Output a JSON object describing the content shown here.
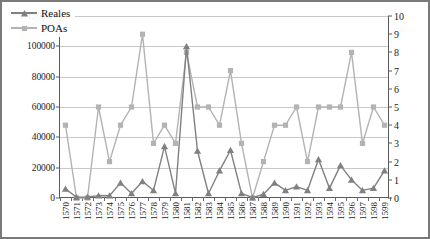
{
  "chart_data": {
    "type": "line",
    "title": "",
    "xlabel": "",
    "ylabel": "",
    "grid": true,
    "legend_position": "top-left",
    "categories": [
      "1570",
      "1571",
      "1572",
      "1573",
      "1574",
      "1575",
      "1576",
      "1577",
      "1578",
      "1579",
      "1580",
      "1581",
      "1582",
      "1583",
      "1584",
      "1585",
      "1586",
      "1587",
      "1588",
      "1589",
      "1590",
      "1591",
      "1592",
      "1593",
      "1594",
      "1595",
      "1596",
      "1597",
      "1598",
      "1599"
    ],
    "left_axis": {
      "label": "",
      "ylim": [
        0,
        120000
      ],
      "ticks": [
        "0",
        "20000",
        "40000",
        "60000",
        "80000",
        "100000",
        "120000"
      ],
      "tick_values": [
        0,
        20000,
        40000,
        60000,
        80000,
        100000,
        120000
      ]
    },
    "right_axis": {
      "label": "",
      "ylim": [
        0,
        10
      ],
      "ticks": [
        "0",
        "1",
        "2",
        "3",
        "4",
        "5",
        "6",
        "7",
        "8",
        "9",
        "10"
      ],
      "tick_values": [
        0,
        1,
        2,
        3,
        4,
        5,
        6,
        7,
        8,
        9,
        10
      ]
    },
    "series": [
      {
        "name": "Reales",
        "axis": "left",
        "color": "#808080",
        "marker": "triangle",
        "values": [
          6000,
          500,
          700,
          1600,
          1500,
          10000,
          3000,
          11000,
          5000,
          34000,
          3000,
          100000,
          31000,
          3000,
          18000,
          31500,
          3000,
          200,
          2500,
          10000,
          5000,
          7500,
          5000,
          25500,
          6500,
          21500,
          12000,
          5000,
          6500,
          18000
        ]
      },
      {
        "name": "POAs",
        "axis": "right",
        "color": "#b3b3b3",
        "marker": "square",
        "values": [
          4,
          0,
          0,
          5,
          2,
          4,
          5,
          9,
          3,
          4,
          3,
          8,
          5,
          5,
          4,
          7,
          3,
          0,
          2,
          4,
          4,
          5,
          2,
          5,
          5,
          5,
          8,
          3,
          5,
          4
        ]
      }
    ]
  },
  "legend": {
    "items": [
      {
        "label": "Reales",
        "marker": "triangle",
        "color": "#808080"
      },
      {
        "label": "POAs",
        "marker": "square",
        "color": "#b3b3b3"
      }
    ]
  }
}
